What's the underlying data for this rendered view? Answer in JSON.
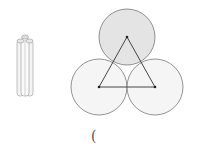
{
  "diagram": {
    "rods_figure": {
      "description": "three bundled cylinders side view"
    },
    "circles_figure": {
      "circles": [
        {
          "cx": 127,
          "cy": 37,
          "r": 28,
          "fill": "#e4e4e4"
        },
        {
          "cx": 99,
          "cy": 87,
          "r": 28,
          "fill": "#f5f5f5"
        },
        {
          "cx": 155,
          "cy": 87,
          "r": 28,
          "fill": "#f5f5f5"
        }
      ],
      "triangle_color": "#333333"
    },
    "caption": "("
  }
}
